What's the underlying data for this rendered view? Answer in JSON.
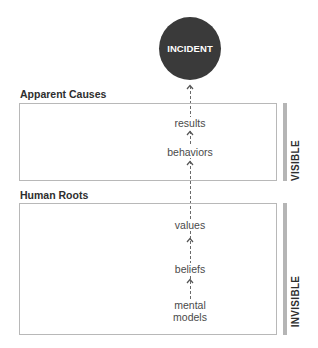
{
  "diagram": {
    "top_node": {
      "label": "INCIDENT",
      "fill": "#3a3a3a",
      "text_color": "#ffffff"
    },
    "sections": [
      {
        "heading": "Apparent Causes",
        "side_label": "VISIBLE",
        "items": [
          {
            "label": "results"
          },
          {
            "label": "behaviors"
          }
        ]
      },
      {
        "heading": "Human Roots",
        "side_label": "INVISIBLE",
        "items": [
          {
            "label": "values"
          },
          {
            "label": "beliefs"
          },
          {
            "label": "mental models",
            "lines": [
              "mental",
              "models"
            ]
          }
        ]
      }
    ],
    "flow_direction": "upward",
    "colors": {
      "box_border": "#b8b8b8",
      "side_bar": "#b5b5b5",
      "arrow": "#6a6a6a",
      "text": "#4a4a4a"
    }
  }
}
